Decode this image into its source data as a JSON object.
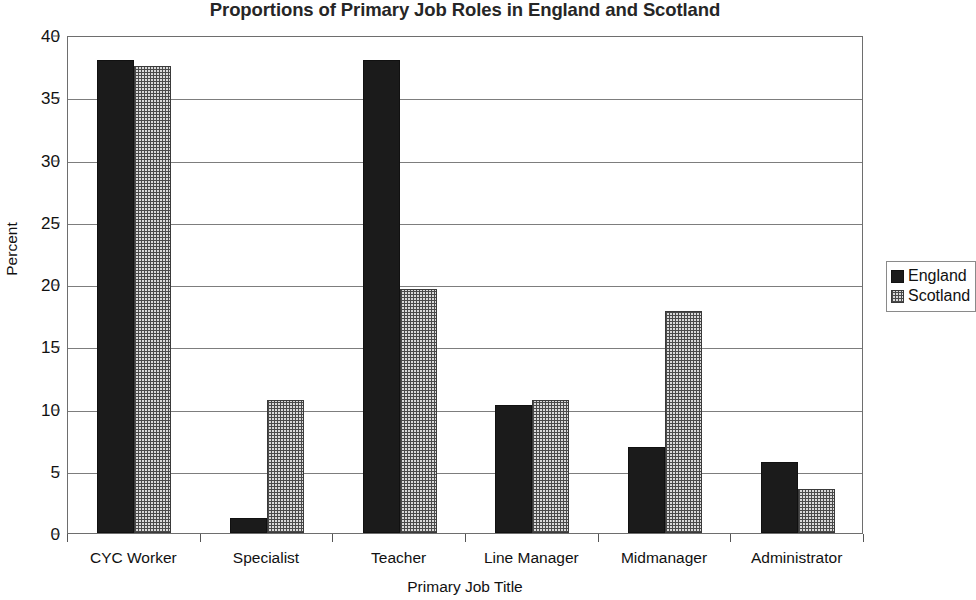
{
  "chart_data": {
    "type": "bar",
    "title": "Proportions of Primary Job Roles in England and Scotland",
    "xlabel": "Primary Job Title",
    "ylabel": "Percent",
    "categories": [
      "CYC Worker",
      "Specialist",
      "Teacher",
      "Line Manager",
      "Midmanager",
      "Administrator"
    ],
    "series": [
      {
        "name": "England",
        "color": "#1b1b1b",
        "values": [
          38.0,
          1.2,
          38.0,
          10.3,
          6.9,
          5.7
        ]
      },
      {
        "name": "Scotland",
        "color": "#d9d9d9",
        "values": [
          37.5,
          10.7,
          19.6,
          10.7,
          17.8,
          3.5
        ]
      }
    ],
    "ylim": [
      0,
      40
    ],
    "yticks": [
      0,
      5,
      10,
      15,
      20,
      25,
      30,
      35,
      40
    ],
    "ytick_labels": [
      "0",
      "5",
      "10",
      "15",
      "20",
      "25",
      "30",
      "35",
      "40"
    ],
    "grid": true,
    "legend_position": "right"
  },
  "legend": {
    "entries": [
      {
        "label": "England",
        "swatch": "solid-black-swatch"
      },
      {
        "label": "Scotland",
        "swatch": "dotted-gray-swatch"
      }
    ]
  }
}
